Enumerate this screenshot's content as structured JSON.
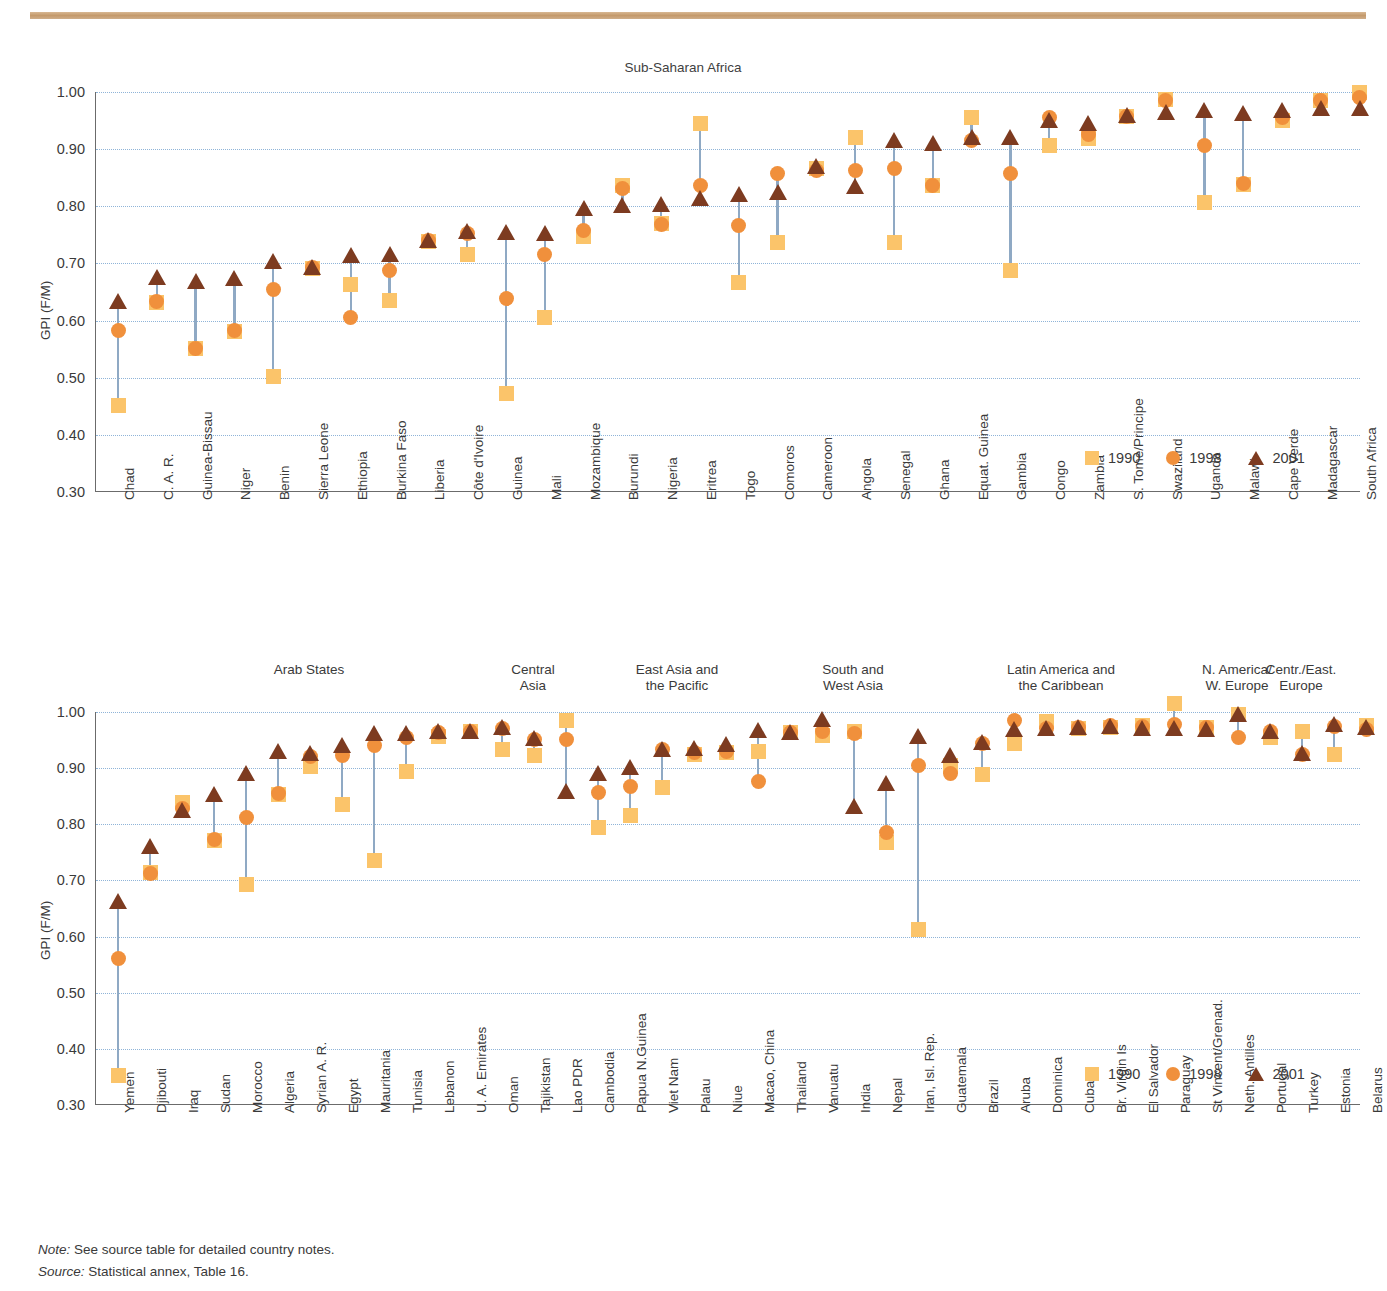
{
  "footer": {
    "note_label": "Note:",
    "note_text": " See source table for detailed country notes.",
    "source_label": "Source:",
    "source_text": " Statistical annex, Table 16."
  },
  "legend": {
    "items": [
      {
        "label": "1990",
        "marker": "square-marker",
        "color": "#fbc46a"
      },
      {
        "label": "1998",
        "marker": "circle-marker",
        "color": "#f0903c"
      },
      {
        "label": "2001",
        "marker": "triangle-marker",
        "color": "#7d3b20"
      }
    ]
  },
  "chart_data": [
    {
      "type": "scatter",
      "title": "Sub-Saharan Africa",
      "ylabel": "GPI (F/M)",
      "xlabel": "",
      "ylim": [
        0.3,
        1.0
      ],
      "yticks": [
        "0.30",
        "0.40",
        "0.50",
        "0.60",
        "0.70",
        "0.80",
        "0.90",
        "1.00"
      ],
      "grid": true,
      "legend_position": "bottom-right",
      "categories": [
        "Chad",
        "C. A. R.",
        "Guinea-Bissau",
        "Niger",
        "Benin",
        "Sierra Leone",
        "Ethiopia",
        "Burkina Faso",
        "Liberia",
        "Côte d'Ivoire",
        "Guinea",
        "Mali",
        "Mozambique",
        "Burundi",
        "Nigeria",
        "Eritrea",
        "Togo",
        "Comoros",
        "Cameroon",
        "Angola",
        "Senegal",
        "Ghana",
        "Equat. Guinea",
        "Gambia",
        "Congo",
        "Zambia",
        "S. Tome/Principe",
        "Swaziland",
        "Uganda",
        "Malawi",
        "Cape Verde",
        "Madagascar",
        "South Africa"
      ],
      "series": [
        {
          "name": "1990",
          "marker": "square-marker",
          "color": "#fbc46a",
          "values": [
            0.451,
            0.631,
            0.551,
            0.581,
            0.503,
            0.692,
            0.664,
            0.636,
            0.738,
            0.716,
            0.473,
            0.605,
            0.747,
            0.836,
            0.77,
            0.945,
            0.666,
            0.737,
            0.866,
            0.921,
            0.737,
            0.837,
            0.956,
            0.688,
            0.906,
            0.918,
            0.958,
            0.987,
            0.806,
            0.839,
            0.951,
            0.985,
            1.0
          ]
        },
        {
          "name": "1998",
          "marker": "circle-marker",
          "color": "#f0903c",
          "values": [
            0.583,
            0.633,
            0.551,
            0.582,
            0.654,
            0.693,
            0.605,
            0.687,
            0.74,
            0.752,
            0.638,
            0.716,
            0.757,
            0.832,
            0.769,
            0.837,
            0.766,
            0.857,
            0.862,
            0.863,
            0.866,
            0.836,
            0.916,
            0.857,
            0.955,
            0.925,
            0.957,
            0.985,
            0.907,
            0.84,
            0.955,
            0.985,
            0.99
          ]
        },
        {
          "name": "2001",
          "marker": "triangle-marker",
          "color": "#7d3b20",
          "values": [
            0.633,
            0.674,
            0.668,
            0.672,
            0.702,
            0.692,
            0.713,
            0.714,
            0.74,
            0.755,
            0.753,
            0.752,
            0.795,
            0.8,
            0.803,
            0.813,
            0.82,
            0.823,
            0.868,
            0.833,
            0.914,
            0.909,
            0.919,
            0.92,
            0.95,
            0.944,
            0.958,
            0.963,
            0.966,
            0.962,
            0.967,
            0.971,
            0.971
          ]
        }
      ]
    },
    {
      "type": "scatter",
      "title": "",
      "ylabel": "GPI (F/M)",
      "xlabel": "",
      "ylim": [
        0.3,
        1.0
      ],
      "yticks": [
        "0.30",
        "0.40",
        "0.50",
        "0.60",
        "0.70",
        "0.80",
        "0.90",
        "1.00"
      ],
      "grid": true,
      "legend_position": "bottom-right",
      "region_headers": [
        {
          "label": "Arab States",
          "start": 0,
          "end": 12
        },
        {
          "label": "Central\nAsia",
          "start": 13,
          "end": 13
        },
        {
          "label": "East Asia and\nthe Pacific",
          "start": 14,
          "end": 21
        },
        {
          "label": "South and\nWest Asia",
          "start": 22,
          "end": 24
        },
        {
          "label": "Latin America and\nthe Caribbean",
          "start": 25,
          "end": 34
        },
        {
          "label": "N. America/\nW. Europe",
          "start": 35,
          "end": 35
        },
        {
          "label": "Centr./East.\nEurope",
          "start": 36,
          "end": 38
        }
      ],
      "categories": [
        "Yemen",
        "Djibouti",
        "Iraq",
        "Sudan",
        "Morocco",
        "Algeria",
        "Syrian A. R.",
        "Egypt",
        "Mauritania",
        "Tunisia",
        "Lebanon",
        "U. A. Emirates",
        "Oman",
        "Tajikistan",
        "Lao PDR",
        "Cambodia",
        "Papua N.Guinea",
        "Viet Nam",
        "Palau",
        "Niue",
        "Macao, China",
        "Thailand",
        "Vanuatu",
        "India",
        "Nepal",
        "Iran, Isl. Rep.",
        "Guatemala",
        "Brazil",
        "Aruba",
        "Dominica",
        "Cuba",
        "Br. Virgin Is",
        "El Salvador",
        "Paraguay",
        "St Vincent/Grenad.",
        "Neth. Antilles",
        "Portugal",
        "Turkey",
        "Estonia",
        "Belarus"
      ],
      "series": [
        {
          "name": "1990",
          "marker": "square-marker",
          "color": "#fbc46a",
          "values": [
            0.353,
            0.714,
            0.838,
            0.772,
            0.692,
            0.853,
            0.903,
            0.835,
            0.735,
            0.894,
            0.957,
            0.966,
            0.934,
            0.922,
            0.985,
            0.795,
            0.816,
            0.865,
            0.925,
            0.927,
            0.93,
            0.964,
            0.958,
            0.966,
            0.767,
            0.613,
            0.905,
            0.888,
            0.944,
            0.983,
            0.971,
            0.973,
            0.976,
            1.016,
            0.973,
            0.996,
            0.955,
            0.965,
            0.925,
            0.976,
            0.97
          ]
        },
        {
          "name": "1998",
          "marker": "circle-marker",
          "color": "#f0903c",
          "values": [
            0.561,
            0.713,
            0.828,
            0.773,
            0.812,
            0.855,
            0.921,
            0.922,
            0.94,
            0.955,
            0.963,
            0.966,
            0.971,
            0.951,
            0.951,
            0.857,
            0.868,
            0.934,
            0.928,
            0.929,
            0.876,
            0.964,
            0.966,
            0.962,
            0.785,
            0.905,
            0.89,
            0.944,
            0.985,
            0.97,
            0.972,
            0.976,
            0.975,
            0.978,
            0.972,
            0.955,
            0.965,
            0.925,
            0.975,
            0.968
          ]
        },
        {
          "name": "2001",
          "marker": "triangle-marker",
          "color": "#7d3b20",
          "values": [
            0.661,
            0.76,
            0.824,
            0.853,
            0.89,
            0.928,
            0.925,
            0.94,
            0.961,
            0.96,
            0.965,
            0.965,
            0.972,
            0.952,
            0.858,
            0.889,
            0.9,
            0.933,
            0.934,
            0.941,
            0.966,
            0.962,
            0.986,
            0.831,
            0.872,
            0.955,
            0.922,
            0.945,
            0.968,
            0.969,
            0.971,
            0.973,
            0.969,
            0.97,
            0.968,
            0.995,
            0.965,
            0.925,
            0.976,
            0.972
          ]
        }
      ]
    }
  ]
}
